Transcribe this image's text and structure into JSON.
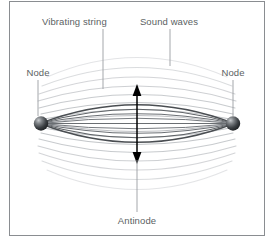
{
  "figure": {
    "frame": {
      "border_color": "#8a8d91",
      "background_color": "#ffffff"
    },
    "labels": {
      "vibrating_string": "Vibrating string",
      "sound_waves": "Sound waves",
      "node_left": "Node",
      "node_right": "Node",
      "antinode": "Antinode"
    },
    "colors": {
      "label_text": "#5b5f63",
      "leader_line": "#9a9da1",
      "string_curve_dark": "#4a4e52",
      "string_curve_mid": "#71757a",
      "sound_wave": "#b9bcc0",
      "node_sphere_dark": "#2e3134",
      "node_sphere_light": "#c7cacd",
      "arrow": "#000000"
    },
    "elements": {
      "node_count": 2,
      "string_curve_count": 9,
      "sound_arc_count_top": 8,
      "sound_arc_count_bottom": 8,
      "antinode_arrow": "double-headed vertical arrow"
    }
  }
}
